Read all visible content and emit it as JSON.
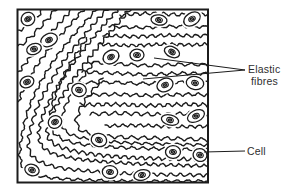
{
  "labels": {
    "elastic": {
      "line1": "Elastic",
      "line2": "fibres"
    },
    "cell": "Cell"
  },
  "colors": {
    "ink": "#1c1c1c",
    "background": "#ffffff",
    "label_text": "#2e2e2e"
  },
  "diagram": {
    "box": {
      "x": 17.5,
      "y": 9.5,
      "width": 190.5,
      "height": 173
    },
    "fibres": [
      [
        [
          44,
          8
        ],
        [
          36,
          18
        ],
        [
          26,
          27
        ],
        [
          14,
          32
        ]
      ],
      [
        [
          57,
          8
        ],
        [
          45,
          22
        ],
        [
          32,
          36
        ],
        [
          20,
          46
        ],
        [
          13,
          50
        ]
      ],
      [
        [
          73,
          8
        ],
        [
          58,
          25
        ],
        [
          42,
          43
        ],
        [
          28,
          60
        ],
        [
          17,
          74
        ],
        [
          13,
          78
        ]
      ],
      [
        [
          85,
          8
        ],
        [
          66,
          29
        ],
        [
          48,
          50
        ],
        [
          32,
          72
        ],
        [
          22,
          92
        ],
        [
          16,
          108
        ],
        [
          13,
          112
        ]
      ],
      [
        [
          98,
          8
        ],
        [
          76,
          32
        ],
        [
          55,
          58
        ],
        [
          38,
          86
        ],
        [
          27,
          112
        ],
        [
          22,
          134
        ],
        [
          19,
          155
        ],
        [
          23,
          170
        ],
        [
          40,
          177
        ],
        [
          78,
          180
        ],
        [
          128,
          181
        ],
        [
          178,
          181
        ],
        [
          211,
          181
        ]
      ],
      [
        [
          108,
          8
        ],
        [
          86,
          33
        ],
        [
          64,
          60
        ],
        [
          46,
          89
        ],
        [
          34,
          114
        ],
        [
          29,
          135
        ],
        [
          28,
          150
        ],
        [
          36,
          161
        ],
        [
          58,
          168
        ],
        [
          96,
          172
        ],
        [
          140,
          174
        ],
        [
          186,
          175
        ],
        [
          211,
          175
        ]
      ],
      [
        [
          119,
          8
        ],
        [
          96,
          34
        ],
        [
          73,
          63
        ],
        [
          54,
          92
        ],
        [
          42,
          116
        ],
        [
          38,
          134
        ],
        [
          41,
          147
        ],
        [
          55,
          155
        ],
        [
          83,
          160
        ],
        [
          121,
          163
        ],
        [
          166,
          165
        ],
        [
          211,
          166
        ]
      ],
      [
        [
          131,
          8
        ],
        [
          108,
          35
        ],
        [
          84,
          64
        ],
        [
          63,
          94
        ],
        [
          50,
          117
        ],
        [
          46,
          133
        ],
        [
          51,
          143
        ],
        [
          68,
          150
        ],
        [
          97,
          155
        ],
        [
          137,
          158
        ],
        [
          178,
          159
        ],
        [
          211,
          160
        ]
      ],
      [
        [
          87,
          38
        ],
        [
          67,
          68
        ],
        [
          55,
          95
        ],
        [
          49,
          118
        ],
        [
          52,
          132
        ],
        [
          64,
          141
        ],
        [
          92,
          146
        ],
        [
          132,
          148
        ],
        [
          174,
          149
        ],
        [
          211,
          150
        ]
      ],
      [
        [
          94,
          62
        ],
        [
          74,
          89
        ],
        [
          63,
          110
        ],
        [
          61,
          126
        ],
        [
          69,
          135
        ],
        [
          92,
          140
        ],
        [
          127,
          143
        ],
        [
          167,
          144
        ],
        [
          211,
          145
        ]
      ],
      [
        [
          103,
          78
        ],
        [
          85,
          100
        ],
        [
          76,
          117
        ],
        [
          77,
          128
        ],
        [
          88,
          134
        ],
        [
          113,
          137
        ],
        [
          152,
          138
        ],
        [
          187,
          139
        ],
        [
          211,
          140
        ]
      ],
      [
        [
          120,
          15
        ],
        [
          150,
          13
        ],
        [
          180,
          15
        ],
        [
          211,
          14
        ]
      ],
      [
        [
          109,
          26
        ],
        [
          140,
          28
        ],
        [
          172,
          26
        ],
        [
          211,
          27
        ]
      ],
      [
        [
          103,
          35
        ],
        [
          134,
          37
        ],
        [
          166,
          35
        ],
        [
          198,
          36
        ],
        [
          211,
          35
        ]
      ],
      [
        [
          99,
          44
        ],
        [
          130,
          46
        ],
        [
          162,
          44
        ],
        [
          194,
          45
        ],
        [
          211,
          44
        ]
      ],
      [
        [
          88,
          62
        ],
        [
          120,
          64
        ],
        [
          150,
          66
        ],
        [
          180,
          64
        ],
        [
          211,
          65
        ]
      ],
      [
        [
          82,
          72
        ],
        [
          115,
          73
        ],
        [
          147,
          75
        ],
        [
          179,
          73
        ],
        [
          211,
          74
        ]
      ],
      [
        [
          78,
          83
        ],
        [
          110,
          82
        ],
        [
          143,
          84
        ],
        [
          176,
          82
        ],
        [
          211,
          83
        ]
      ],
      [
        [
          84,
          95
        ],
        [
          118,
          94
        ],
        [
          152,
          96
        ],
        [
          186,
          94
        ],
        [
          211,
          95
        ]
      ],
      [
        [
          80,
          105
        ],
        [
          115,
          104
        ],
        [
          150,
          106
        ],
        [
          185,
          104
        ],
        [
          211,
          105
        ]
      ],
      [
        [
          90,
          114
        ],
        [
          125,
          113
        ],
        [
          160,
          115
        ],
        [
          195,
          113
        ],
        [
          211,
          114
        ]
      ],
      [
        [
          105,
          126
        ],
        [
          140,
          125
        ],
        [
          175,
          127
        ],
        [
          211,
          126
        ]
      ]
    ],
    "cells": [
      [
        28,
        19
      ],
      [
        49,
        40
      ],
      [
        34,
        49
      ],
      [
        159,
        20
      ],
      [
        192,
        19
      ],
      [
        111,
        57
      ],
      [
        137,
        55
      ],
      [
        172,
        52
      ],
      [
        27,
        82
      ],
      [
        79,
        90
      ],
      [
        165,
        85
      ],
      [
        195,
        83
      ],
      [
        55,
        122
      ],
      [
        170,
        120
      ],
      [
        196,
        116
      ],
      [
        99,
        140
      ],
      [
        173,
        152
      ],
      [
        200,
        155
      ],
      [
        32,
        170
      ],
      [
        110,
        172
      ],
      [
        142,
        175
      ]
    ],
    "leaders": [
      {
        "name": "elastic-upper",
        "points": [
          [
            154,
            58
          ],
          [
            245,
            70
          ]
        ]
      },
      {
        "name": "elastic-lower",
        "points": [
          [
            143,
            79
          ],
          [
            245,
            70
          ]
        ]
      },
      {
        "name": "cell",
        "points": [
          [
            204,
            152
          ],
          [
            245,
            151
          ]
        ]
      }
    ]
  }
}
